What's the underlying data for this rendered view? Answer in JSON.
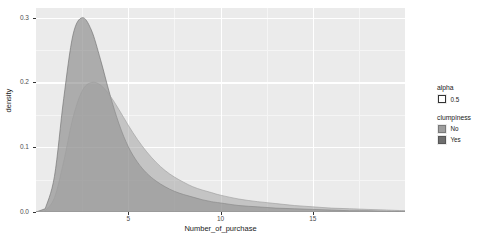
{
  "chart": {
    "type": "area",
    "title": "",
    "xlabel": "Number_of_purchase",
    "ylabel": "density",
    "panel_bg": "#EBEBEB",
    "grid_color": "#FFFFFF",
    "grid": "on",
    "legend_position": "right"
  },
  "axes": {
    "x": {
      "ticks": [
        "5",
        "10",
        "15"
      ],
      "tick_values": [
        5,
        10,
        15
      ],
      "min": 0.0,
      "max": 20.0,
      "minor_ticks": [
        2.5,
        7.5,
        12.5,
        17.5
      ]
    },
    "y": {
      "ticks": [
        "0.0",
        "0.1",
        "0.2",
        "0.3"
      ],
      "tick_values": [
        0.0,
        0.1,
        0.2,
        0.3
      ],
      "min": -0.004,
      "max": 0.315,
      "minor_ticks": [
        0.05,
        0.15,
        0.25
      ]
    }
  },
  "legends": [
    {
      "name": "alpha-legend",
      "title": "alpha",
      "items": [
        {
          "label": "0.5",
          "color": "#FFFFFF",
          "border": "#333333"
        }
      ]
    },
    {
      "name": "clumpiness-legend",
      "title": "clumpiness",
      "items": [
        {
          "label": "No",
          "color": "#9E9E9E",
          "border": "#7A7A7A"
        },
        {
          "label": "Yes",
          "color": "#6E6E6E",
          "border": "#575757"
        }
      ]
    }
  ],
  "chart_data": {
    "type": "area",
    "title": "",
    "xlabel": "Number_of_purchase",
    "ylabel": "density",
    "xlim": [
      0.0,
      20.0
    ],
    "ylim": [
      0.0,
      0.315
    ],
    "grid": "on",
    "legend_position": "right",
    "alpha": 0.5,
    "legend_title": "clumpiness",
    "series": [
      {
        "name": "Yes",
        "color": "#6E6E6E",
        "peak_x": 2.5,
        "peak_y": 0.3,
        "x": [
          0.5,
          1.0,
          1.5,
          2.0,
          2.5,
          3.0,
          3.5,
          4.0,
          4.5,
          5.0,
          5.5,
          6.0,
          6.5,
          7.0,
          7.5,
          8.0,
          8.5,
          9.0,
          9.5,
          10.0,
          11.0,
          12.0,
          13.0,
          14.0,
          15.0,
          16.0,
          17.0,
          18.0,
          19.0,
          20.0
        ],
        "values": [
          0.005,
          0.055,
          0.175,
          0.273,
          0.3,
          0.281,
          0.235,
          0.182,
          0.136,
          0.101,
          0.077,
          0.06,
          0.048,
          0.039,
          0.032,
          0.027,
          0.023,
          0.019,
          0.016,
          0.014,
          0.01,
          0.008,
          0.006,
          0.005,
          0.004,
          0.003,
          0.002,
          0.002,
          0.001,
          0.001
        ]
      },
      {
        "name": "No",
        "color": "#9E9E9E",
        "peak_x": 3.5,
        "peak_y": 0.2,
        "x": [
          0.5,
          1.0,
          1.5,
          2.0,
          2.5,
          3.0,
          3.5,
          4.0,
          4.5,
          5.0,
          5.5,
          6.0,
          6.5,
          7.0,
          7.5,
          8.0,
          8.5,
          9.0,
          9.5,
          10.0,
          11.0,
          12.0,
          13.0,
          14.0,
          15.0,
          16.0,
          17.0,
          18.0,
          19.0,
          20.0
        ],
        "values": [
          0.002,
          0.022,
          0.078,
          0.145,
          0.187,
          0.2,
          0.196,
          0.18,
          0.158,
          0.134,
          0.112,
          0.093,
          0.077,
          0.064,
          0.054,
          0.046,
          0.039,
          0.034,
          0.03,
          0.026,
          0.02,
          0.016,
          0.013,
          0.01,
          0.008,
          0.006,
          0.005,
          0.004,
          0.003,
          0.002
        ]
      }
    ]
  }
}
